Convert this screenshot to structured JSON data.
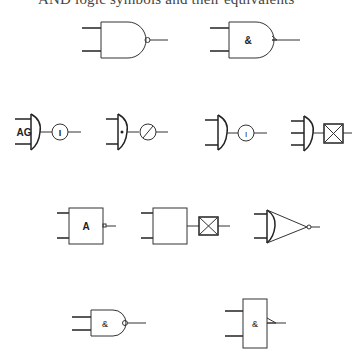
{
  "caption": "AND logic symbols and their equivalents",
  "symbols": [
    {
      "id": "nand-distinctive",
      "label": "",
      "row": 1
    },
    {
      "id": "nand-distinctive-amp",
      "label": "&",
      "row": 1
    },
    {
      "id": "and-ag-inverter",
      "label": "AG",
      "inverter_label": "I",
      "row": 2
    },
    {
      "id": "and-dot-slash-inverter",
      "label": "•",
      "row": 2
    },
    {
      "id": "and-inverter",
      "inverter_label": "I",
      "row": 2
    },
    {
      "id": "and3-crossbox",
      "row": 2
    },
    {
      "id": "rect-a-nand",
      "label": "A",
      "row": 3
    },
    {
      "id": "rect-crossbox",
      "row": 3
    },
    {
      "id": "or-triangle-inverter",
      "row": 3
    },
    {
      "id": "nand-amp-small",
      "label": "&",
      "row": 4
    },
    {
      "id": "iec-nand",
      "label": "&",
      "row": 4
    }
  ],
  "labels": {
    "amp": "&",
    "ag": "AG",
    "a": "A",
    "i": "I"
  }
}
